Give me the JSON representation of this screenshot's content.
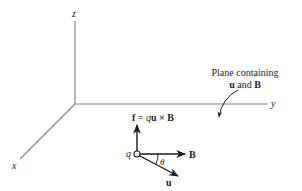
{
  "diagram": {
    "axes": {
      "z_label": "z",
      "y_label": "y",
      "x_label": "x"
    },
    "plane_annotation": {
      "line1": "Plane containing",
      "line2_u": "u",
      "line2_and": " and ",
      "line2_B": "B"
    },
    "force_equation": {
      "f": "f",
      "equals": " = ",
      "q": "q",
      "u": "u",
      "cross": " × ",
      "B": "B"
    },
    "charge_label": "q",
    "vectors": {
      "B_label": "B",
      "u_label": "u",
      "angle_label": "θ"
    },
    "colors": {
      "axis": "#808080",
      "vector": "#1a1a1a",
      "text": "#222222",
      "background": "#ffffff"
    }
  }
}
